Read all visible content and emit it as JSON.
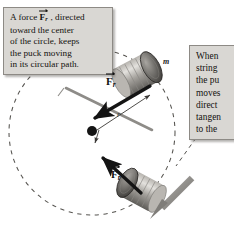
{
  "figure": {
    "background_color": "#ffffff"
  },
  "callouts": [
    {
      "id": "left",
      "lines": [
        "A force ⃗F_r , directed",
        "toward the center",
        "of the circle, keeps",
        "the puck moving",
        "in its circular path."
      ],
      "line1_prefix": "A force ",
      "line1_suffix": " , directed",
      "line2": "toward the center",
      "line3": "of the circle, keeps",
      "line4": "the puck moving",
      "line5": "in its circular path.",
      "fill_color": "#d9d7d3",
      "border_color": "#8d8a85"
    },
    {
      "id": "right",
      "clipped": true,
      "line1": "When",
      "line2": "string",
      "line3": "the pu",
      "line4": "moves",
      "line5": "direct",
      "line6": "tangen",
      "line7": "to the",
      "fill_color": "#d9d7d3",
      "border_color": "#8d8a85"
    }
  ],
  "labels": {
    "force_top": {
      "symbol": "F",
      "subscript": "r",
      "vector": true
    },
    "force_bottom": {
      "symbol": "F",
      "subscript": "r",
      "vector": true
    },
    "mass": "m",
    "radius": "r"
  },
  "colors": {
    "arrow_black": "#141414",
    "leader_gray": "#8e8c88",
    "dashed_circle": "#55534f",
    "motion_arrow": "#8a8884",
    "puck_dark": "#4a4845",
    "puck_light": "#cfccc7"
  },
  "geometry": {
    "circle_center": [
      92,
      132
    ],
    "circle_radius": 83,
    "puck_top": [
      146,
      70
    ],
    "puck_bottom": [
      152,
      196
    ]
  }
}
